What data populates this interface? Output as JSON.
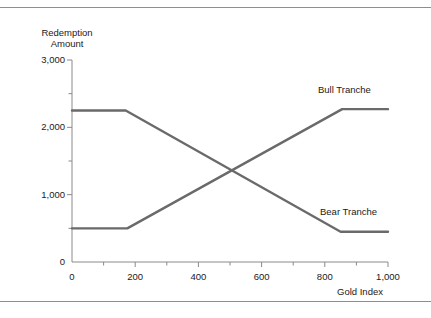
{
  "figure": {
    "background_color": "#ffffff",
    "rule_color": "#8e8e8e",
    "line_color": "#6a6a6a",
    "axis_color": "#8a8a8a",
    "text_color": "#1a1a1a"
  },
  "chart_data": {
    "type": "line",
    "title": "",
    "subtitle": "",
    "xlabel": "Gold Index",
    "ylabel": "Redemption Amount",
    "ylabel_lines": [
      "Redemption",
      "Amount"
    ],
    "xlim": [
      0,
      1000
    ],
    "ylim": [
      0,
      3000
    ],
    "grid": false,
    "legend_position": "inline-annotation",
    "x_major_ticks": [
      0,
      200,
      400,
      600,
      800,
      1000
    ],
    "x_major_tick_labels": [
      "0",
      "200",
      "400",
      "600",
      "800",
      "1,000"
    ],
    "x_minor_ticks": [
      100,
      300,
      500,
      700,
      900
    ],
    "y_major_ticks": [
      0,
      1000,
      2000,
      3000
    ],
    "y_major_tick_labels": [
      "0",
      "1,000",
      "2,000",
      "3,000"
    ],
    "y_minor_ticks": [
      500,
      1500,
      2500
    ],
    "annotations": [
      {
        "text": "Bull Tranche",
        "x": 860,
        "y": 2560
      },
      {
        "text": "Bear Tranche",
        "x": 870,
        "y": 740
      }
    ],
    "series": [
      {
        "name": "Bear Tranche",
        "color": "#6a6a6a",
        "points": [
          {
            "x": 0,
            "y": 2250
          },
          {
            "x": 170,
            "y": 2250
          },
          {
            "x": 850,
            "y": 450
          },
          {
            "x": 1000,
            "y": 450
          }
        ]
      },
      {
        "name": "Bull Tranche",
        "color": "#6a6a6a",
        "points": [
          {
            "x": 0,
            "y": 500
          },
          {
            "x": 175,
            "y": 500
          },
          {
            "x": 855,
            "y": 2270
          },
          {
            "x": 1000,
            "y": 2270
          }
        ]
      }
    ]
  }
}
